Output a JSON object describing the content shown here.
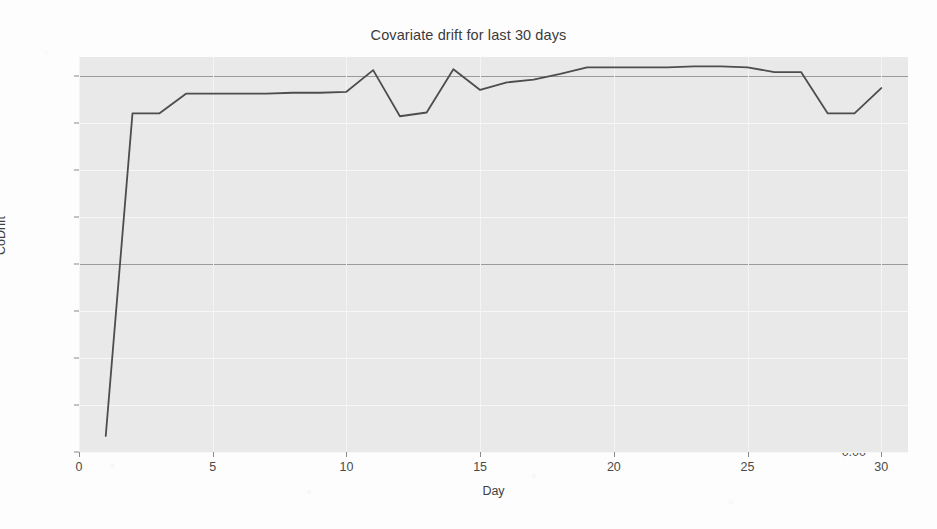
{
  "chart_data": {
    "type": "line",
    "title": "Covariate drift for last 30 days",
    "xlabel": "Day",
    "ylabel": "CoDrift",
    "xlim": [
      0,
      31
    ],
    "ylim": [
      0.0,
      0.42
    ],
    "grid": true,
    "legend": "none",
    "line_color": "#4d4d4d",
    "plot_background": "#e9e9e9",
    "x": [
      1,
      2,
      3,
      4,
      5,
      6,
      7,
      8,
      9,
      10,
      11,
      12,
      13,
      14,
      15,
      16,
      17,
      18,
      19,
      20,
      21,
      22,
      23,
      24,
      25,
      26,
      27,
      28,
      29,
      30
    ],
    "series": [
      {
        "name": "CoDrift",
        "values": [
          0.017,
          0.36,
          0.36,
          0.381,
          0.381,
          0.381,
          0.381,
          0.382,
          0.382,
          0.383,
          0.406,
          0.357,
          0.361,
          0.407,
          0.385,
          0.393,
          0.396,
          0.402,
          0.409,
          0.409,
          0.409,
          0.409,
          0.41,
          0.41,
          0.409,
          0.404,
          0.404,
          0.36,
          0.36,
          0.387
        ]
      }
    ],
    "xticks": [
      0,
      5,
      10,
      15,
      20,
      25,
      30
    ],
    "xtick_labels": [
      "0",
      "5",
      "10",
      "15",
      "20",
      "25",
      "30"
    ],
    "yticks": [
      0.0,
      0.05,
      0.1,
      0.15,
      0.2,
      0.25,
      0.3,
      0.35,
      0.4
    ],
    "ytick_labels": [
      "0.00",
      "0.05",
      "0.10",
      "0.15",
      "0.20",
      "0.25",
      "0.30",
      "0.35",
      "0.40"
    ],
    "major_gridlines_y": [
      0.2,
      0.4
    ]
  }
}
